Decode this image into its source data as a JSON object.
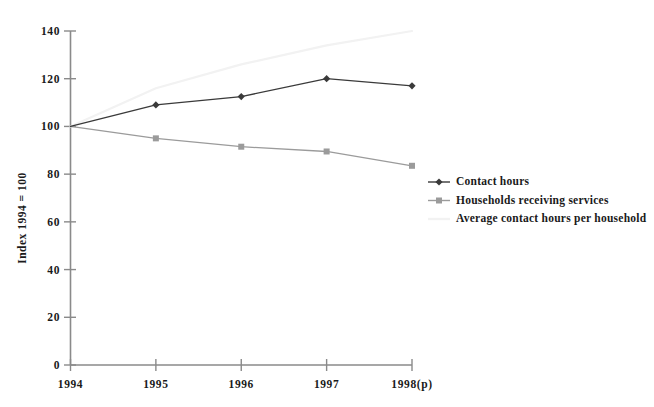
{
  "chart_data": {
    "type": "line",
    "title": "",
    "xlabel": "",
    "ylabel": "Index 1994 = 100",
    "categories": [
      "1994",
      "1995",
      "1996",
      "1997",
      "1998(p)"
    ],
    "ylim": [
      0,
      140
    ],
    "yticks": [
      0,
      20,
      40,
      60,
      80,
      100,
      120,
      140
    ],
    "ytick_labels": [
      "0",
      "20",
      "40",
      "60",
      "80",
      "100",
      "120",
      "140"
    ],
    "grid": false,
    "legend_position": "right-middle",
    "series": [
      {
        "name": "Contact hours",
        "values": [
          100,
          109,
          112.5,
          120,
          117
        ],
        "color": "#3a3a3a",
        "marker": "diamond"
      },
      {
        "name": "Households receiving services",
        "values": [
          100,
          95,
          91.5,
          89.5,
          83.5
        ],
        "color": "#9b9b9b",
        "marker": "square"
      },
      {
        "name": "Average contact hours per household",
        "values": [
          100,
          116,
          126,
          134,
          140
        ],
        "color": "#f2f2f2",
        "marker": "none"
      }
    ]
  },
  "legend": {
    "items": [
      {
        "label": "Contact hours"
      },
      {
        "label": "Households receiving services"
      },
      {
        "label": "Average contact hours per household"
      }
    ]
  }
}
